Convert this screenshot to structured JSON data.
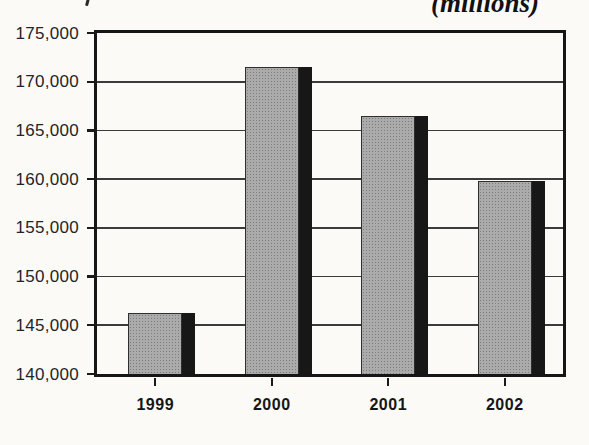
{
  "chart_data": {
    "type": "bar",
    "annotation": "(millions)",
    "categories": [
      "1999",
      "2000",
      "2001",
      "2002"
    ],
    "values": [
      146300,
      171500,
      166500,
      159800
    ],
    "title": "",
    "xlabel": "",
    "ylabel": "",
    "ylim": [
      140000,
      175000
    ],
    "ytick_step": 5000,
    "yticks": [
      175000,
      170000,
      165000,
      160000,
      155000,
      150000,
      145000,
      140000
    ],
    "ytick_labels": [
      "175,000",
      "170,000",
      "165,000",
      "160,000",
      "155,000",
      "150,000",
      "145,000",
      "140,000"
    ],
    "grid": true,
    "legend": "none",
    "colors": {
      "bar_fill": "#ababab",
      "bar_stipple": "#7c7c7c",
      "bar_outline": "#2e2e2e",
      "shadow": "#171717",
      "frame": "#161616",
      "gridline": "#3b3b3b",
      "text": "#1e1e1e",
      "background": "#fbfaf7"
    }
  }
}
